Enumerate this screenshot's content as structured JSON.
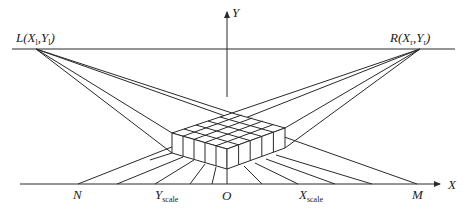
{
  "figure": {
    "top_fragment_text": "……………………………………………………。",
    "axes": {
      "x_label": "X",
      "y_label": "Y"
    },
    "points": {
      "left_camera": {
        "name": "L",
        "coord": "(X",
        "sub1": "l",
        "mid": ",Y",
        "sub2": "l",
        "end": ")"
      },
      "right_camera": {
        "name": "R",
        "coord": "(X",
        "sub1": "r",
        "mid": ",Y",
        "sub2": "r",
        "end": ")"
      },
      "origin": "O",
      "n_point": "N",
      "m_point": "M",
      "y_scale": {
        "main": "Y",
        "sub": "scale"
      },
      "x_scale": {
        "main": "X",
        "sub": "scale"
      }
    },
    "colors": {
      "line": "#2a2a2a",
      "background": "#ffffff"
    }
  }
}
